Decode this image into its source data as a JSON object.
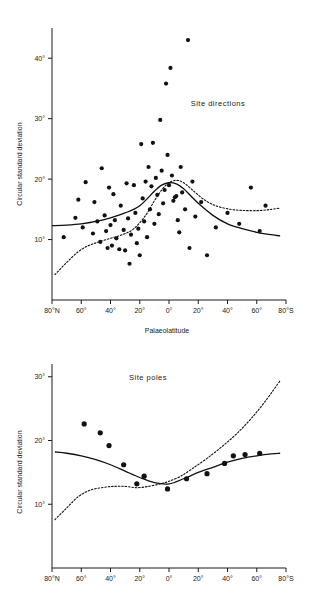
{
  "figure": {
    "caption": ""
  },
  "chart_data": [
    {
      "id": "site-directions",
      "type": "scatter",
      "title": "Site  directions",
      "xlabel": "Palaeolatitude",
      "ylabel": "Circular standard deviation",
      "xlim": [
        -80,
        80
      ],
      "ylim": [
        0,
        45
      ],
      "grid": false,
      "legend": "none",
      "xtick_labels": [
        "80°N",
        "60°",
        "40°",
        "20°",
        "0°",
        "20°",
        "40°",
        "60°",
        "80°S"
      ],
      "xtick_values": [
        -80,
        -60,
        -40,
        -20,
        0,
        20,
        40,
        60,
        80
      ],
      "ytick_labels": [
        "10°",
        "20°",
        "30°",
        "40°"
      ],
      "ytick_values": [
        10,
        20,
        30,
        40
      ],
      "points": [
        [
          -72,
          10.4
        ],
        [
          -64,
          13.6
        ],
        [
          -62,
          16.6
        ],
        [
          -59,
          12.0
        ],
        [
          -57,
          19.5
        ],
        [
          -52,
          11.0
        ],
        [
          -51,
          16.2
        ],
        [
          -49,
          13.0
        ],
        [
          -47,
          9.6
        ],
        [
          -46,
          21.8
        ],
        [
          -44,
          14.0
        ],
        [
          -43,
          11.4
        ],
        [
          -42,
          8.6
        ],
        [
          -41,
          18.6
        ],
        [
          -40,
          12.4
        ],
        [
          -39,
          9.0
        ],
        [
          -38,
          17.5
        ],
        [
          -37,
          13.2
        ],
        [
          -36,
          10.2
        ],
        [
          -34,
          8.4
        ],
        [
          -33,
          15.6
        ],
        [
          -31,
          11.6
        ],
        [
          -30,
          8.2
        ],
        [
          -29,
          19.3
        ],
        [
          -28,
          13.5
        ],
        [
          -27,
          6.0
        ],
        [
          -26,
          10.8
        ],
        [
          -24,
          19.0
        ],
        [
          -23,
          14.4
        ],
        [
          -22,
          9.4
        ],
        [
          -21,
          11.8
        ],
        [
          -20,
          7.4
        ],
        [
          -19,
          25.8
        ],
        [
          -18,
          16.8
        ],
        [
          -17,
          13.0
        ],
        [
          -16,
          19.6
        ],
        [
          -15,
          10.4
        ],
        [
          -14,
          22.0
        ],
        [
          -13,
          15.0
        ],
        [
          -12,
          18.8
        ],
        [
          -11,
          26.0
        ],
        [
          -10,
          12.6
        ],
        [
          -9,
          20.2
        ],
        [
          -8,
          17.4
        ],
        [
          -7,
          14.2
        ],
        [
          -6,
          29.8
        ],
        [
          -5,
          21.4
        ],
        [
          -4,
          16.0
        ],
        [
          -3,
          18.2
        ],
        [
          -2,
          35.8
        ],
        [
          -1,
          24.0
        ],
        [
          0,
          19.0
        ],
        [
          1,
          38.4
        ],
        [
          2,
          20.6
        ],
        [
          3,
          16.4
        ],
        [
          4,
          17.0
        ],
        [
          5,
          17.2
        ],
        [
          6,
          13.2
        ],
        [
          7,
          11.2
        ],
        [
          8,
          22.0
        ],
        [
          9,
          17.8
        ],
        [
          11,
          15.0
        ],
        [
          13,
          43.0
        ],
        [
          14,
          8.6
        ],
        [
          16,
          19.6
        ],
        [
          18,
          13.8
        ],
        [
          22,
          16.2
        ],
        [
          26,
          7.4
        ],
        [
          32,
          12.0
        ],
        [
          40,
          14.4
        ],
        [
          48,
          12.6
        ],
        [
          56,
          18.6
        ],
        [
          62,
          11.4
        ],
        [
          66,
          15.6
        ]
      ],
      "curves": [
        {
          "name": "solid-trend",
          "style": "solid",
          "x": [
            -80,
            -70,
            -60,
            -50,
            -40,
            -30,
            -20,
            -10,
            -5,
            0,
            5,
            10,
            15,
            20,
            30,
            40,
            50,
            60,
            70,
            76
          ],
          "y": [
            12.3,
            12.4,
            12.6,
            13.0,
            13.6,
            14.4,
            15.6,
            18.0,
            19.0,
            19.4,
            19.2,
            18.4,
            17.2,
            16.0,
            14.0,
            12.6,
            11.8,
            11.2,
            10.8,
            10.6
          ]
        },
        {
          "name": "dotted-trend",
          "style": "dotted",
          "x": [
            -78,
            -70,
            -62,
            -55,
            -48,
            -40,
            -32,
            -24,
            -16,
            -10,
            -5,
            0,
            5,
            10,
            16,
            24,
            32,
            42,
            52,
            62,
            70,
            76
          ],
          "y": [
            4.2,
            6.2,
            8.0,
            9.0,
            9.6,
            10.2,
            10.8,
            11.8,
            14.0,
            16.4,
            18.2,
            19.4,
            19.8,
            19.4,
            18.2,
            16.6,
            15.6,
            15.0,
            14.8,
            14.8,
            15.0,
            15.2
          ]
        }
      ]
    },
    {
      "id": "site-poles",
      "type": "scatter",
      "title": "Site  poles",
      "xlabel": "",
      "ylabel": "Circular standard deviation",
      "xlim": [
        -80,
        80
      ],
      "ylim": [
        0,
        32
      ],
      "grid": false,
      "legend": "none",
      "xtick_labels": [
        "80°N",
        "60°",
        "40°",
        "20°",
        "0°",
        "20°",
        "40°",
        "60°",
        "80°S"
      ],
      "xtick_values": [
        -80,
        -60,
        -40,
        -20,
        0,
        20,
        40,
        60,
        80
      ],
      "ytick_labels": [
        "10°",
        "20°",
        "30°"
      ],
      "ytick_values": [
        10,
        20,
        30
      ],
      "points": [
        [
          -58,
          22.6
        ],
        [
          -47,
          21.2
        ],
        [
          -41,
          19.2
        ],
        [
          -31,
          16.2
        ],
        [
          -22,
          13.2
        ],
        [
          -17,
          14.4
        ],
        [
          -1,
          12.4
        ],
        [
          12,
          14.0
        ],
        [
          26,
          14.8
        ],
        [
          38,
          16.4
        ],
        [
          44,
          17.6
        ],
        [
          52,
          17.8
        ],
        [
          62,
          18.0
        ]
      ],
      "curves": [
        {
          "name": "solid-trend",
          "style": "solid",
          "x": [
            -78,
            -70,
            -60,
            -50,
            -40,
            -30,
            -20,
            -10,
            0,
            10,
            20,
            30,
            40,
            50,
            60,
            70,
            76
          ],
          "y": [
            18.2,
            18.0,
            17.6,
            17.0,
            16.2,
            15.2,
            14.2,
            13.4,
            13.2,
            14.0,
            15.0,
            15.8,
            16.6,
            17.2,
            17.6,
            17.9,
            18.0
          ]
        },
        {
          "name": "dotted-trend",
          "style": "dotted",
          "x": [
            -78,
            -70,
            -62,
            -54,
            -46,
            -38,
            -30,
            -22,
            -14,
            -6,
            0,
            8,
            16,
            26,
            36,
            46,
            56,
            66,
            76
          ],
          "y": [
            7.6,
            9.4,
            11.2,
            12.2,
            12.6,
            12.8,
            12.8,
            12.6,
            12.8,
            13.2,
            13.6,
            14.4,
            15.6,
            17.2,
            19.0,
            21.0,
            23.4,
            26.2,
            29.4
          ]
        }
      ]
    }
  ]
}
